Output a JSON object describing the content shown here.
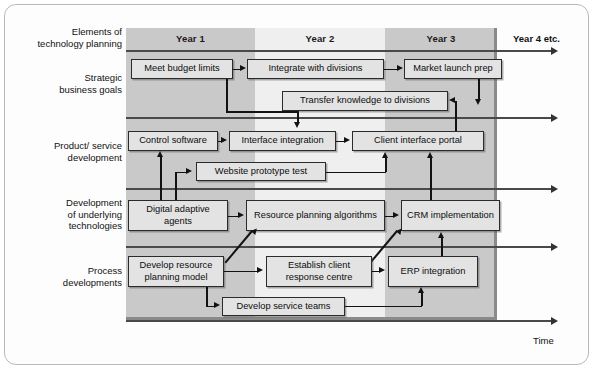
{
  "diagram": {
    "corner_label_line1": "Elements of",
    "corner_label_line2": "technology planning",
    "time_axis_label": "Time",
    "year4_label": "Year 4 etc.",
    "colors": {
      "band_dark": "#c9c9c9",
      "band_light": "#efefef",
      "box_fill": "#e3e3e3",
      "box_border": "#2b2b2b",
      "line": "#121212"
    }
  },
  "columns": [
    {
      "label": "Year 1"
    },
    {
      "label": "Year 2"
    },
    {
      "label": "Year 3"
    }
  ],
  "rows": [
    {
      "label_line1": "Strategic",
      "label_line2": "business goals",
      "label_line3": ""
    },
    {
      "label_line1": "Product/ service",
      "label_line2": "development",
      "label_line3": ""
    },
    {
      "label_line1": "Development",
      "label_line2": "of underlying",
      "label_line3": "technologies"
    },
    {
      "label_line1": "Process",
      "label_line2": "developments",
      "label_line3": ""
    }
  ],
  "boxes": [
    {
      "id": "meet-budget-limits",
      "label": "Meet budget limits",
      "row": "Strategic business goals",
      "year": "Year 1"
    },
    {
      "id": "integrate-with-divisions",
      "label": "Integrate with divisions",
      "row": "Strategic business goals",
      "year": "Year 2"
    },
    {
      "id": "market-launch-prep",
      "label": "Market launch prep",
      "row": "Strategic business goals",
      "year": "Year 3"
    },
    {
      "id": "transfer-knowledge",
      "label": "Transfer knowledge to divisions",
      "row": "Strategic business goals",
      "year": "Year 2"
    },
    {
      "id": "control-software",
      "label": "Control software",
      "row": "Product/ service development",
      "year": "Year 1"
    },
    {
      "id": "interface-integration",
      "label": "Interface integration",
      "row": "Product/ service development",
      "year": "Year 1"
    },
    {
      "id": "client-interface-portal",
      "label": "Client interface portal",
      "row": "Product/ service development",
      "year": "Year 2"
    },
    {
      "id": "website-prototype-test",
      "label": "Website prototype test",
      "row": "Product/ service development",
      "year": "Year 1"
    },
    {
      "id": "digital-adaptive-agents",
      "label": "Digital adaptive agents",
      "row": "Development of underlying technologies",
      "year": "Year 1"
    },
    {
      "id": "resource-planning-algorithms",
      "label": "Resource planning algorithms",
      "row": "Development of underlying technologies",
      "year": "Year 2"
    },
    {
      "id": "crm-implementation",
      "label": "CRM implementation",
      "row": "Development of underlying technologies",
      "year": "Year 3"
    },
    {
      "id": "develop-resource-planning-model",
      "label": "Develop resource planning model",
      "row": "Process developments",
      "year": "Year 1"
    },
    {
      "id": "establish-client-response-centre",
      "label": "Establish client response centre",
      "row": "Process developments",
      "year": "Year 2"
    },
    {
      "id": "erp-integration",
      "label": "ERP integration",
      "row": "Process developments",
      "year": "Year 3"
    },
    {
      "id": "develop-service-teams",
      "label": "Develop service teams",
      "row": "Process developments",
      "year": "Year 1"
    }
  ]
}
